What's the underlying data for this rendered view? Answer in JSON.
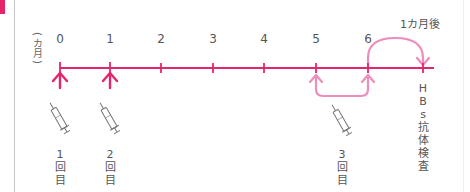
{
  "colors": {
    "accent": "#e4246b",
    "accent_light": "#ee8dbb",
    "text": "#555555",
    "border": "#c8c8c8"
  },
  "axis": {
    "unit_label": "カ月",
    "ticks": [
      {
        "label": "0",
        "x": 60
      },
      {
        "label": "1",
        "x": 110
      },
      {
        "label": "2",
        "x": 161
      },
      {
        "label": "3",
        "x": 213
      },
      {
        "label": "4",
        "x": 264
      },
      {
        "label": "5",
        "x": 316
      },
      {
        "label": "6",
        "x": 368
      }
    ]
  },
  "interval_label": "1カ月後",
  "doses": [
    {
      "number": "1",
      "suffix_1": "回",
      "suffix_2": "目",
      "month": "0"
    },
    {
      "number": "2",
      "suffix_1": "回",
      "suffix_2": "目",
      "month": "1"
    },
    {
      "number": "3",
      "suffix_1": "回",
      "suffix_2": "目",
      "month": "6"
    }
  ],
  "test": {
    "chars": [
      "H",
      "B",
      "s",
      "抗",
      "体",
      "検",
      "査"
    ]
  },
  "icons": {
    "dose_marker": "up-arrow-icon",
    "syringe": "syringe-icon",
    "interval": "curved-arrow-icon"
  }
}
